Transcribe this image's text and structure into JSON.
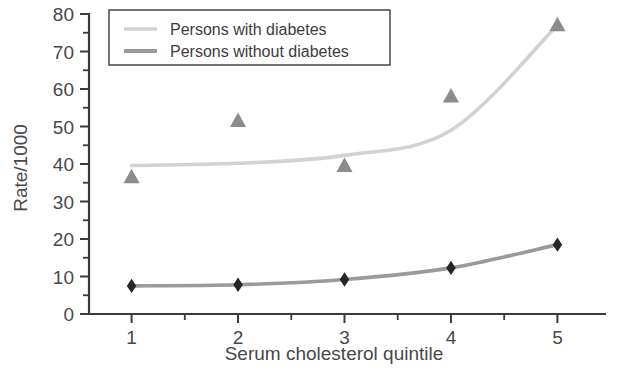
{
  "chart_data": {
    "type": "line",
    "title": "",
    "xlabel": "Serum cholesterol quintile",
    "ylabel": "Rate/1000",
    "xlim": [
      0.6,
      5.4
    ],
    "ylim": [
      0,
      80
    ],
    "xticks": [
      "1",
      "2",
      "3",
      "4",
      "5"
    ],
    "xtick_values": [
      1,
      2,
      3,
      4,
      5
    ],
    "yticks": [
      "0",
      "10",
      "20",
      "30",
      "40",
      "50",
      "60",
      "70",
      "80"
    ],
    "ytick_values": [
      0,
      10,
      20,
      30,
      40,
      50,
      60,
      70,
      80
    ],
    "minor_ticks": true,
    "grid": false,
    "legend_position": "top-left",
    "x": [
      1,
      2,
      3,
      4,
      5
    ],
    "series": [
      {
        "name": "Persons with diabetes",
        "color": "#d2d2d2",
        "marker": "triangle",
        "marker_color": "#8c8c8c",
        "values": [
          36.5,
          51.5,
          39.5,
          58.0,
          77.0
        ],
        "fitted_curve": [
          39.6,
          40.2,
          42.3,
          49.0,
          77.0
        ]
      },
      {
        "name": "Persons without diabetes",
        "color": "#9a9a9a",
        "marker": "diamond",
        "marker_color": "#262626",
        "values": [
          7.5,
          7.8,
          9.2,
          12.3,
          18.5
        ],
        "fitted_curve": [
          7.5,
          7.8,
          9.2,
          12.3,
          18.5
        ]
      }
    ]
  },
  "legend": {
    "items": [
      {
        "label": "Persons with diabetes"
      },
      {
        "label": "Persons without diabetes"
      }
    ]
  },
  "axes": {
    "y_title": "Rate/1000",
    "x_title": "Serum cholesterol quintile"
  },
  "colors": {
    "with_diabetes_line": "#d2d2d2",
    "without_diabetes_line": "#9a9a9a",
    "triangle_marker": "#8c8c8c",
    "diamond_marker": "#262626",
    "axis": "#3a3a3a",
    "text": "#484848",
    "background": "#ffffff"
  }
}
